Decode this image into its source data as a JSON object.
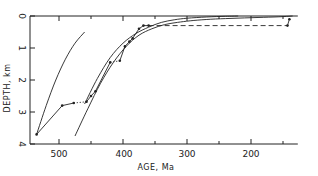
{
  "chart_data": {
    "type": "line",
    "title": "",
    "xlabel": "AGE, Ma",
    "ylabel": "DEPTH, km",
    "xlim": [
      550,
      130
    ],
    "ylim": [
      4,
      0
    ],
    "x_reversed": true,
    "y_inverted": true,
    "grid": false,
    "legend": null,
    "x_ticks": [
      500,
      400,
      300,
      200
    ],
    "x_minor_ticks": [
      450,
      350,
      250,
      150
    ],
    "y_ticks": [
      0,
      1,
      2,
      3,
      4
    ],
    "series": [
      {
        "name": "subsidence-curve-left",
        "style": "solid",
        "markers": false,
        "x": [
          535,
          520,
          505,
          490,
          475,
          460
        ],
        "y": [
          3.7,
          2.8,
          2.0,
          1.35,
          0.85,
          0.5
        ]
      },
      {
        "name": "subsidence-curve-middle",
        "style": "solid",
        "markers": false,
        "x": [
          460,
          440,
          420,
          400,
          380,
          360,
          340,
          320,
          300,
          270,
          240,
          220
        ],
        "y": [
          2.75,
          1.95,
          1.3,
          0.85,
          0.55,
          0.35,
          0.2,
          0.12,
          0.07,
          0.03,
          0.01,
          0.0
        ]
      },
      {
        "name": "subsidence-curve-right",
        "style": "solid",
        "markers": false,
        "x": [
          475,
          455,
          435,
          415,
          395,
          375,
          355,
          335,
          315,
          295,
          270,
          240,
          210,
          180,
          150,
          135
        ],
        "y": [
          3.75,
          2.9,
          2.1,
          1.45,
          0.95,
          0.6,
          0.4,
          0.27,
          0.2,
          0.15,
          0.11,
          0.08,
          0.06,
          0.04,
          0.02,
          0.0
        ]
      },
      {
        "name": "observed-section",
        "style": "solid-with-dotted-and-dashed-gaps",
        "markers": true,
        "points": [
          {
            "x": 535,
            "y": 3.7,
            "link": "solid"
          },
          {
            "x": 495,
            "y": 2.8,
            "link": "solid"
          },
          {
            "x": 477,
            "y": 2.72,
            "link": "solid"
          },
          {
            "x": 457,
            "y": 2.68,
            "link": "dotted"
          },
          {
            "x": 450,
            "y": 2.5,
            "link": "solid"
          },
          {
            "x": 443,
            "y": 2.35,
            "link": "solid"
          },
          {
            "x": 420,
            "y": 1.45,
            "link": "solid"
          },
          {
            "x": 405,
            "y": 1.4,
            "link": "dotted"
          },
          {
            "x": 397,
            "y": 0.95,
            "link": "solid"
          },
          {
            "x": 390,
            "y": 0.8,
            "link": "solid"
          },
          {
            "x": 385,
            "y": 0.7,
            "link": "solid"
          },
          {
            "x": 375,
            "y": 0.4,
            "link": "solid"
          },
          {
            "x": 368,
            "y": 0.3,
            "link": "solid"
          },
          {
            "x": 360,
            "y": 0.3,
            "link": "solid"
          },
          {
            "x": 143,
            "y": 0.3,
            "link": "dashed"
          },
          {
            "x": 140,
            "y": 0.1,
            "link": "solid"
          }
        ]
      }
    ]
  },
  "axes": {
    "x_title": "AGE, Ma",
    "y_title": "DEPTH, km",
    "x_labels": [
      "500",
      "400",
      "300",
      "200"
    ],
    "y_labels": [
      "0",
      "1",
      "2",
      "3",
      "4"
    ]
  }
}
